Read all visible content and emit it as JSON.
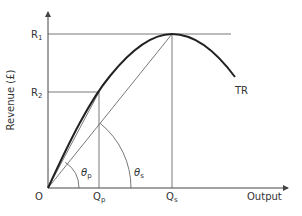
{
  "diagram": {
    "y_axis": {
      "label": "Revenue (£)"
    },
    "x_axis": {
      "label": "Output"
    },
    "origin": {
      "label": "O"
    },
    "curve": {
      "label": "TR"
    },
    "y_ticks": [
      {
        "main": "R",
        "sub": "1"
      },
      {
        "main": "R",
        "sub": "2"
      }
    ],
    "x_ticks": [
      {
        "main": "Q",
        "sub": "p"
      },
      {
        "main": "Q",
        "sub": "s"
      }
    ],
    "angles": [
      {
        "main": "θ",
        "sub": "p"
      },
      {
        "main": "θ",
        "sub": "s"
      }
    ],
    "colors": {
      "line": "#444444",
      "curve": "#222222",
      "text": "#333333"
    }
  }
}
